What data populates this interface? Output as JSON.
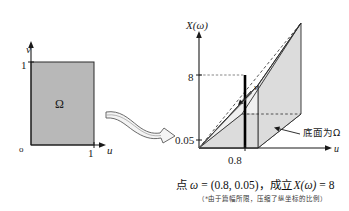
{
  "figure": {
    "left_panel": {
      "name": "unit-square-domain",
      "axis_v_label": "v",
      "axis_u_label": "u",
      "origin_label": "o",
      "tick_v_1": "1",
      "tick_u_1": "1",
      "region_label": "Ω",
      "fill_color": "#b8b8b8",
      "stroke_color": "#2b2b2b"
    },
    "arrow": {
      "name": "ribbon-arrow",
      "direction": "left-to-right",
      "stroke_color": "#555555"
    },
    "right_panel": {
      "name": "three-d-wedge",
      "axis_vertical_label": "X(ω)",
      "axis_u_label": "u",
      "axis_v_label": "v",
      "tick_8": "8",
      "tick_005": "0.05",
      "tick_08": "0.8",
      "annotation_base": "底面为Ω",
      "base_fill_color": "#b0b0b0",
      "side_fill_color": "#dcdcdc",
      "stroke_color": "#2b2b2b"
    }
  },
  "caption": {
    "main": "点 ω = (0.8, 0.05)，成立 X(ω) = 8",
    "main_parts": {
      "prefix": "点",
      "omega": "ω",
      "equals": "=",
      "point": "(0.8, 0.05)，",
      "holds": "成立",
      "x_omega": "X(ω)",
      "equals2": "=",
      "value": "8"
    },
    "note": "（*由于篇幅所限，压缩了纵坐标的比例）"
  },
  "colors": {
    "ink": "#1a1a1a",
    "gray_fill": "#b8b8b8",
    "light_gray_fill": "#dcdcdc",
    "page_bg": "#ffffff"
  }
}
